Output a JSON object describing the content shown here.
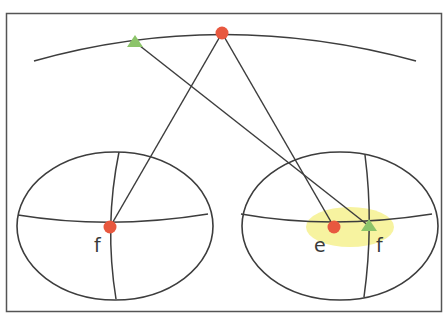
{
  "diagram": {
    "type": "geometry-illustration",
    "colors": {
      "line": "#3d3d3d",
      "red_point": "#e8583f",
      "green_point": "#8cc46a",
      "highlight": "#f7f3a0",
      "frame": "#555555"
    },
    "labels": {
      "left_f": "f",
      "right_e": "e",
      "right_f": "f"
    },
    "points": {
      "arc_red": {
        "x": 222,
        "y": 33,
        "shape": "circle"
      },
      "arc_green": {
        "x": 135,
        "y": 42,
        "shape": "triangle"
      },
      "left_red_f": {
        "x": 110,
        "y": 227,
        "shape": "circle"
      },
      "right_red_e": {
        "x": 334,
        "y": 227,
        "shape": "circle"
      },
      "right_green_f": {
        "x": 369,
        "y": 226,
        "shape": "triangle"
      }
    }
  }
}
